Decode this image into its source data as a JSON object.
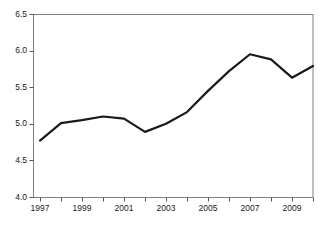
{
  "chart_data": {
    "type": "line",
    "title": "",
    "subtitle": "",
    "xlabel": "",
    "ylabel": "",
    "x": [
      1997,
      1998,
      1999,
      2000,
      2001,
      2002,
      2003,
      2004,
      2005,
      2006,
      2007,
      2008,
      2009,
      2010
    ],
    "values": [
      4.77,
      5.01,
      5.05,
      5.1,
      5.07,
      4.89,
      5.0,
      5.16,
      5.45,
      5.72,
      5.95,
      5.88,
      5.63,
      5.79
    ],
    "series": [
      {
        "name": "value",
        "values": [
          4.77,
          5.01,
          5.05,
          5.1,
          5.07,
          4.89,
          5.0,
          5.16,
          5.45,
          5.72,
          5.95,
          5.88,
          5.63,
          5.79
        ]
      }
    ],
    "xlim": [
      1997,
      2010
    ],
    "ylim": [
      4.0,
      6.5
    ],
    "y_ticks": [
      4.0,
      4.5,
      5.0,
      5.5,
      6.0,
      6.5
    ],
    "y_tick_labels": [
      "4.0",
      "4.5",
      "5.0",
      "5.5",
      "6.0",
      "6.5"
    ],
    "x_ticks": [
      1997,
      1998,
      1999,
      2000,
      2001,
      2002,
      2003,
      2004,
      2005,
      2006,
      2007,
      2008,
      2009,
      2010
    ],
    "x_tick_labels_shown": [
      "1997",
      "1999",
      "2001",
      "2003",
      "2005",
      "2007",
      "2009"
    ],
    "x_labeled_ticks": [
      1997,
      1999,
      2001,
      2003,
      2005,
      2007,
      2009
    ],
    "grid": false,
    "legend": null,
    "legend_position": "none",
    "annotations": [],
    "colors": {
      "line": "#1a1a1a",
      "frame": "#808080",
      "tick": "#555555",
      "label_text": "#1a1a1a",
      "background": "#ffffff"
    },
    "line_width": 2.2
  },
  "axes": {
    "y_labels": [
      {
        "text": "6.5",
        "value": 6.5
      },
      {
        "text": "6.0",
        "value": 6.0
      },
      {
        "text": "5.5",
        "value": 5.5
      },
      {
        "text": "5.0",
        "value": 5.0
      },
      {
        "text": "4.5",
        "value": 4.5
      },
      {
        "text": "4.0",
        "value": 4.0
      }
    ],
    "x_labels": [
      {
        "text": "1997",
        "value": 1997
      },
      {
        "text": "1999",
        "value": 1999
      },
      {
        "text": "2001",
        "value": 2001
      },
      {
        "text": "2003",
        "value": 2003
      },
      {
        "text": "2005",
        "value": 2005
      },
      {
        "text": "2007",
        "value": 2007
      },
      {
        "text": "2009",
        "value": 2009
      }
    ]
  },
  "geometry": {
    "plot_left": 40,
    "plot_right": 313,
    "plot_top": 14,
    "plot_bottom": 197
  }
}
